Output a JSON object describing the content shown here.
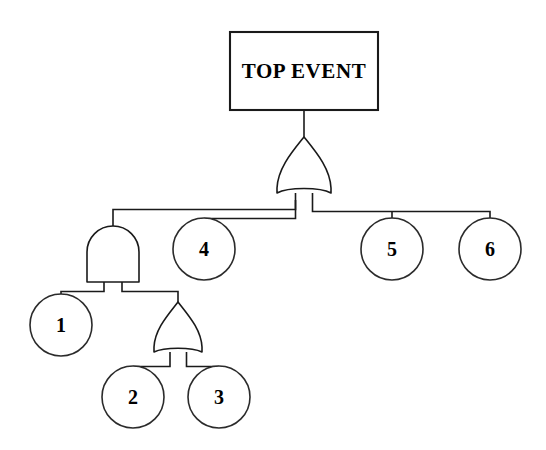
{
  "diagram": {
    "type": "fault-tree",
    "background_color": "#ffffff",
    "line_color": "#1a1a1a",
    "text_color": "#000000"
  },
  "top_event": {
    "label": "TOP EVENT",
    "shape": "rectangle",
    "x": 230,
    "y": 32,
    "width": 148,
    "height": 78
  },
  "gates": [
    {
      "id": "gate-top-or",
      "type": "OR",
      "name": "top-or-gate",
      "cx": 304,
      "top_y": 137,
      "bottom_y": 193,
      "half_width": 27
    },
    {
      "id": "gate-and",
      "type": "AND",
      "name": "and-gate",
      "cx": 113,
      "top_y": 228,
      "bottom_y": 282,
      "half_width": 26
    },
    {
      "id": "gate-lower-or",
      "type": "OR",
      "name": "lower-or-gate",
      "cx": 178,
      "top_y": 302,
      "bottom_y": 352,
      "half_width": 24
    }
  ],
  "basic_events": [
    {
      "id": "event-1",
      "label": "1",
      "cx": 61,
      "cy": 325,
      "r": 31
    },
    {
      "id": "event-2",
      "label": "2",
      "cx": 133,
      "cy": 397,
      "r": 31
    },
    {
      "id": "event-3",
      "label": "3",
      "cx": 219,
      "cy": 397,
      "r": 31
    },
    {
      "id": "event-4",
      "label": "4",
      "cx": 204,
      "cy": 249,
      "r": 31
    },
    {
      "id": "event-5",
      "label": "5",
      "cx": 392,
      "cy": 249,
      "r": 31
    },
    {
      "id": "event-6",
      "label": "6",
      "cx": 490,
      "cy": 249,
      "r": 31
    }
  ],
  "connectors": {
    "top_box_to_gate": "M 304 110 L 304 137",
    "top_gate_left_leg": "M 295 193 L 295 210 L 113 210 L 113 228",
    "top_gate_left_leg_b": "M 295 205 L 295 218 L 204 218 L 204 218",
    "top_gate_right_leg": "M 313 193 L 313 212 L 490 212 L 490 218",
    "to_event_4": "M 204 218 L 204 218",
    "and_left_leg": "M 104 282 L 104 292 L 61 292 L 61 294",
    "and_right_leg": "M 122 282 L 122 292 L 178 292 L 178 302",
    "or2_left_leg": "M 170 352 L 170 366 L 133 366 L 133 366",
    "or2_right_leg": "M 187 352 L 187 366 L 219 366 L 219 366",
    "event_5_drop": "M 392 212 L 392 218"
  },
  "structure_note": {
    "top_inputs": [
      "and-gate",
      "4",
      "5",
      "6"
    ],
    "and_inputs": [
      "1",
      "lower-or-gate"
    ],
    "lower_or_inputs": [
      "2",
      "3"
    ]
  }
}
